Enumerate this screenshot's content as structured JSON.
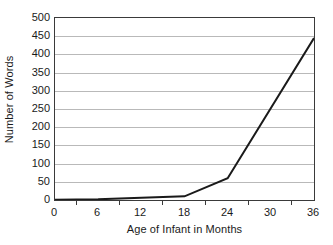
{
  "chart_data": {
    "type": "line",
    "title": "",
    "xlabel": "Age of Infant in Months",
    "ylabel": "Number of Words",
    "x": [
      0,
      6,
      12,
      18,
      24,
      36
    ],
    "values": [
      1,
      2,
      6,
      10,
      60,
      445
    ],
    "series": [
      {
        "name": "Number of Words",
        "values": [
          1,
          2,
          6,
          10,
          60,
          445
        ]
      }
    ],
    "xlim": [
      0,
      36
    ],
    "ylim": [
      0,
      500
    ],
    "x_ticks": [
      "0",
      "6",
      "12",
      "18",
      "24",
      "30",
      "36"
    ],
    "y_ticks": [
      "0",
      "50",
      "100",
      "150",
      "200",
      "250",
      "300",
      "350",
      "400",
      "450",
      "500"
    ],
    "grid": "horizontal",
    "legend": "none",
    "line_color": "#1a1a1a",
    "grid_color": "#b9b9b9",
    "axis_color": "#3a3a3a",
    "background_color": "#ffffff"
  }
}
